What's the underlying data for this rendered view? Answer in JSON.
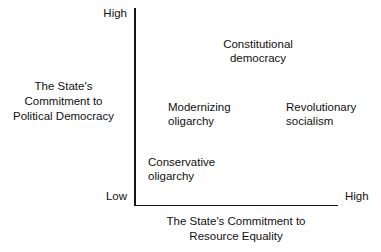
{
  "chart_data": {
    "type": "scatter",
    "title": "",
    "xlabel": "The State's Commitment to Resource Equality",
    "ylabel": "The State's Commitment to Political Democracy",
    "x_ticks": [
      "Low",
      "High"
    ],
    "y_ticks": [
      "Low",
      "High"
    ],
    "grid": false,
    "legend": "none",
    "annotations": [
      {
        "label": "Constitutional democracy",
        "x": "high-mid",
        "y": "high"
      },
      {
        "label": "Modernizing oligarchy",
        "x": "mid",
        "y": "mid"
      },
      {
        "label": "Revolutionary socialism",
        "x": "high",
        "y": "mid"
      },
      {
        "label": "Conservative oligarchy",
        "x": "low",
        "y": "low"
      }
    ]
  },
  "axes": {
    "y_high_label": "High",
    "y_low_label": "Low",
    "x_high_label": "High",
    "y_title_lines": [
      "The State's",
      "Commitment to",
      "Political Democracy"
    ],
    "x_title_lines": [
      "The State's Commitment to",
      "Resource Equality"
    ]
  },
  "quadrants": [
    {
      "name": "constitutional-democracy",
      "lines": [
        "Constitutional",
        "democracy"
      ]
    },
    {
      "name": "modernizing-oligarchy",
      "lines": [
        "Modernizing",
        "oligarchy"
      ]
    },
    {
      "name": "revolutionary-socialism",
      "lines": [
        "Revolutionary",
        "socialism"
      ]
    },
    {
      "name": "conservative-oligarchy",
      "lines": [
        "Conservative",
        "oligarchy"
      ]
    }
  ],
  "colors": {
    "axis": "#141414",
    "text": "#111111",
    "background": "#ffffff"
  }
}
